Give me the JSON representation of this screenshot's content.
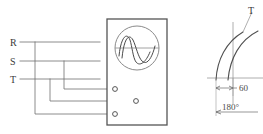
{
  "figure": {
    "type": "electrical-wiring-and-phase-angle-diagram",
    "background_color": "#ffffff",
    "line_color": "#6e6e6e",
    "text_color": "#3a3a3a"
  },
  "left_panel": {
    "name": "three-phase-supply-lines",
    "phase_labels": [
      {
        "text": "R",
        "x": 10,
        "y": 42
      },
      {
        "text": "S",
        "x": 10,
        "y": 61
      },
      {
        "text": "T",
        "x": 10,
        "y": 79
      }
    ],
    "line_count": 3,
    "crossover": "phases cross over before reaching instrument terminals"
  },
  "instrument": {
    "name": "panel-meter-enclosure",
    "box": {
      "x": 107,
      "y": 19,
      "width": 60,
      "height": 106
    },
    "display": {
      "name": "oscilloscope-display",
      "shape": "circle",
      "center_x": 137,
      "center_y": 48,
      "radius": 22,
      "waveform": "two overlapping sine waves",
      "baseline_y": 48
    },
    "terminals": [
      {
        "name": "terminal-1",
        "x": 115,
        "y": 89,
        "radius": 2.4
      },
      {
        "name": "terminal-2",
        "x": 136,
        "y": 101,
        "radius": 2.4
      },
      {
        "name": "terminal-3",
        "x": 115,
        "y": 114,
        "radius": 2.4
      }
    ]
  },
  "right_panel": {
    "name": "phase-angle-diagram",
    "phase_label": {
      "text": "T",
      "x": 248,
      "y": 12
    },
    "dimensions": [
      {
        "name": "angle-60",
        "text": "60",
        "x": 242,
        "y": 89
      },
      {
        "name": "angle-180",
        "text": "180°",
        "x": 222,
        "y": 112
      }
    ],
    "arcs": 2,
    "baseline_y": 98,
    "axis_x": 233
  }
}
